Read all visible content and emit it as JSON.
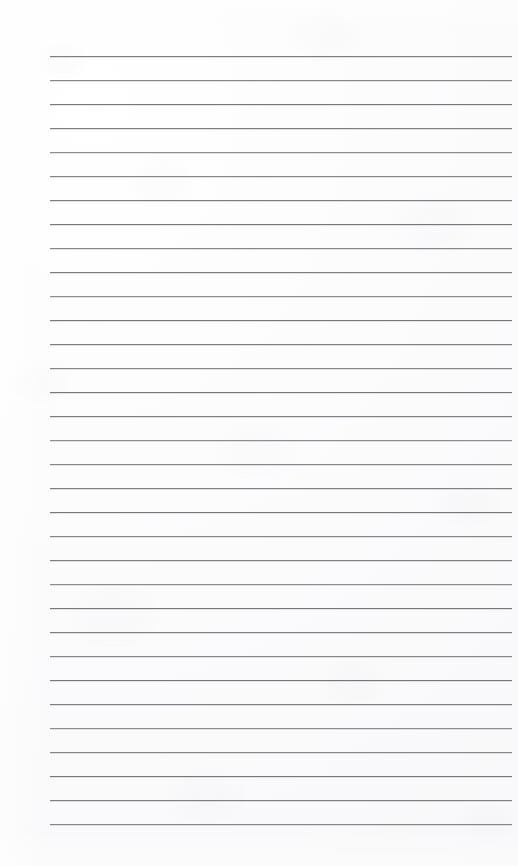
{
  "document": {
    "kind": "scanned-image",
    "subject": "blank ruled notebook page",
    "page_title": "",
    "visible_text": [],
    "text_content": "",
    "orientation": "portrait"
  },
  "canvas": {
    "width": 518,
    "height": 866,
    "paper_color": "#fbfbfc",
    "paper_edge_color": "#ffffff"
  },
  "ruling": {
    "line_count": 33,
    "line_color": "#7e8086",
    "line_thickness_px": 1,
    "line_spacing_px": 24,
    "first_line_y": 56,
    "last_line_y": 824,
    "line_left_x": 50,
    "line_right_x": 512,
    "left_margin_px": 50,
    "right_margin_px": 6,
    "top_margin_px": 56,
    "bottom_margin_px": 42,
    "has_vertical_margin_rule": false,
    "has_header_rule": false,
    "lines_y": [
      56,
      80,
      104,
      128,
      152,
      176,
      200,
      224,
      248,
      272,
      296,
      320,
      344,
      368,
      392,
      416,
      440,
      464,
      488,
      512,
      536,
      560,
      584,
      608,
      632,
      656,
      680,
      704,
      728,
      752,
      776,
      800,
      824
    ],
    "line_tones": [
      "t-a",
      "t-b",
      "t-c",
      "t-a",
      "t-d",
      "t-b",
      "t-a",
      "t-c",
      "t-b",
      "t-a",
      "t-d",
      "t-c",
      "t-a",
      "t-b",
      "t-c",
      "t-a",
      "t-d",
      "t-b",
      "t-a",
      "t-c",
      "t-b",
      "t-a",
      "t-d",
      "t-c",
      "t-a",
      "t-b",
      "t-c",
      "t-a",
      "t-d",
      "t-b",
      "t-c",
      "t-a",
      "t-b"
    ]
  }
}
